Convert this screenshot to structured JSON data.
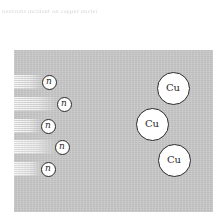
{
  "caption": {
    "text": "neutrons incident on copper nuclei"
  },
  "diagram": {
    "background_color": "#c9c9c9",
    "neutrons": [
      {
        "label": "n",
        "cx": 49,
        "cy": 82,
        "trail_length": 28
      },
      {
        "label": "n",
        "cx": 64,
        "cy": 104,
        "trail_length": 42
      },
      {
        "label": "n",
        "cx": 48,
        "cy": 126,
        "trail_length": 27
      },
      {
        "label": "n",
        "cx": 62,
        "cy": 147,
        "trail_length": 40
      },
      {
        "label": "n",
        "cx": 48,
        "cy": 169,
        "trail_length": 27
      }
    ],
    "copper_atoms": [
      {
        "label": "Cu",
        "cx": 173,
        "cy": 88
      },
      {
        "label": "Cu",
        "cx": 152,
        "cy": 124
      },
      {
        "label": "Cu",
        "cx": 174,
        "cy": 160
      }
    ]
  }
}
